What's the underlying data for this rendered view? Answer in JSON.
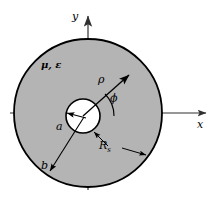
{
  "figure": {
    "type": "cross-section-diagram",
    "colors": {
      "medium_fill": "#b4b4b4",
      "inner_fill": "#ffffff",
      "outline": "#000000",
      "axis": "#404040",
      "background": "#ffffff"
    }
  },
  "axes": {
    "y_label": "y",
    "x_label": "x",
    "origin_x": 88,
    "origin_y": 113
  },
  "labels": {
    "medium": "μ, ε",
    "rho": "ρ",
    "phi": "ϕ",
    "inner_radius": "a",
    "outer_radius": "b",
    "surface_resistance": "R",
    "surface_resistance_sub": "s"
  },
  "geometry": {
    "outer_circle": {
      "cx": 88,
      "cy": 113,
      "r": 74
    },
    "inner_circle": {
      "cx": 83,
      "cy": 116,
      "r": 17
    },
    "rho_arrow": {
      "x1": 83,
      "y1": 116,
      "x2": 129,
      "y2": 75
    },
    "a_arrow": {
      "x1": 83,
      "y1": 116,
      "x2": 67,
      "y2": 113
    },
    "b_arrow": {
      "x1": 83,
      "y1": 116,
      "x2": 48,
      "y2": 172
    },
    "phi_arc_radius": 31
  }
}
